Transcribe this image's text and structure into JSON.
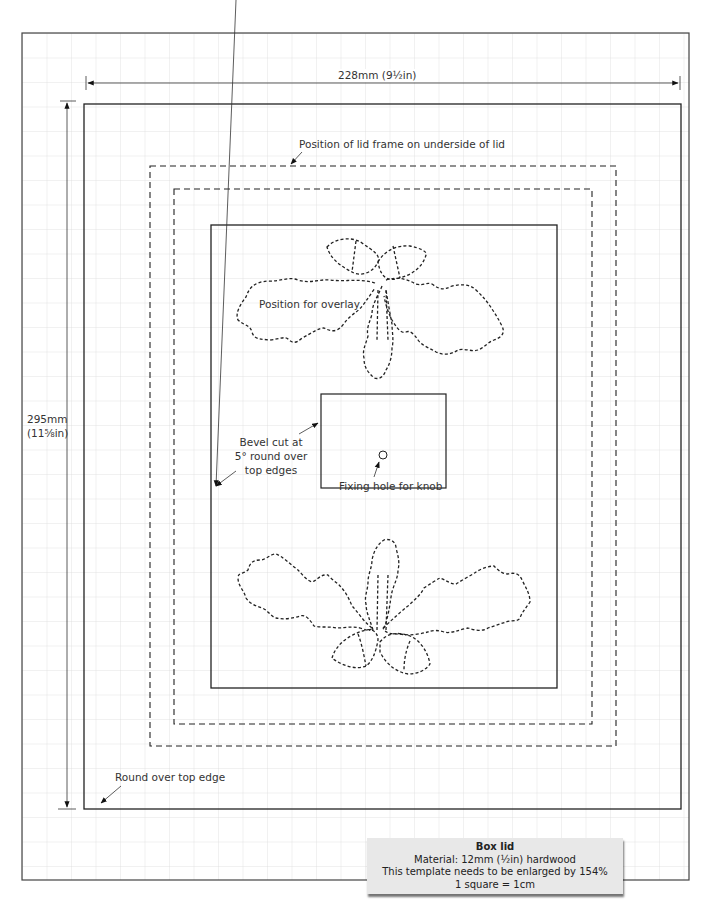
{
  "diagram": {
    "dimensions": {
      "width_label": "228mm (9½in)",
      "height_label_line1": "295mm",
      "height_label_line2": "(11⅝in)"
    },
    "annotations": {
      "lid_frame": "Position of lid frame on underside of lid",
      "overlay": "Position for overlay",
      "bevel_line1": "Bevel cut at",
      "bevel_line2": "5° round over",
      "bevel_line3": "top edges",
      "fixing_hole": "Fixing hole for knob",
      "round_over": "Round over top edge"
    },
    "info_box": {
      "title": "Box lid",
      "material": "Material:  12mm (½in) hardwood",
      "enlarge": "This template needs to be enlarged by 154%",
      "scale": "1 square = 1cm"
    },
    "colors": {
      "grid": "#dcdcdc",
      "line": "#222222",
      "info_bg": "#e8e8e8"
    },
    "grid_square_px": 24.5
  }
}
